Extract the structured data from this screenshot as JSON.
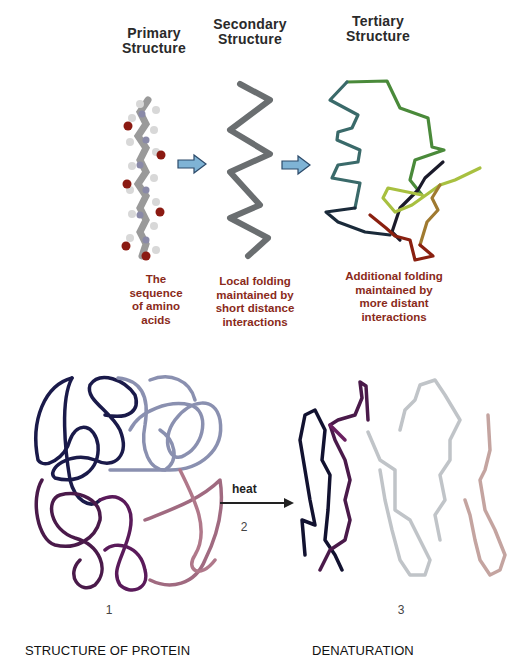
{
  "top_panel": {
    "stages": [
      {
        "title_line1": "Primary",
        "title_line2": "Structure",
        "caption": [
          "The",
          "sequence",
          "of amino",
          "acids"
        ]
      },
      {
        "title_line1": "Secondary",
        "title_line2": "Structure",
        "caption": [
          "Local folding",
          "maintained by",
          "short distance",
          "interactions"
        ]
      },
      {
        "title_line1": "Tertiary",
        "title_line2": "Structure",
        "caption": [
          "Additional folding",
          "maintained by",
          "more distant",
          "interactions"
        ]
      }
    ],
    "arrow_color": "#7fb3d5"
  },
  "bottom_panel": {
    "arrow_label": "heat",
    "step_numbers": [
      "1",
      "2",
      "3"
    ],
    "left_label": "STRUCTURE OF PROTEIN",
    "right_label": "DENATURATION"
  }
}
